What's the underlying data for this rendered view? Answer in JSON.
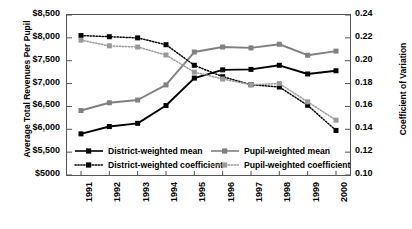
{
  "chart_data": {
    "type": "line",
    "title": "",
    "xlabel": "",
    "ylabel": "Average Total Revenues Per Pupil",
    "y2label": "Coefficient of Variation",
    "categories": [
      "1991",
      "1992",
      "1993",
      "1994",
      "1995",
      "1996",
      "1997",
      "1998",
      "1999",
      "2000"
    ],
    "ylim": [
      5000,
      8500
    ],
    "y2lim": [
      0.1,
      0.24
    ],
    "yticks": [
      "$5000",
      "$5,500",
      "$6,000",
      "$6,500",
      "$7,000",
      "$7,500",
      "$8,000",
      "$8,500"
    ],
    "ytick_values": [
      5000,
      5500,
      6000,
      6500,
      7000,
      7500,
      8000,
      8500
    ],
    "y2ticks": [
      "0.10",
      "0.12",
      "0.14",
      "0.16",
      "0.18",
      "0.20",
      "0.22",
      "0.24"
    ],
    "y2tick_values": [
      0.1,
      0.12,
      0.14,
      0.16,
      0.18,
      0.2,
      0.22,
      0.24
    ],
    "grid": false,
    "legend_position": "bottom-inside",
    "series": [
      {
        "name": "District-weighted mean",
        "axis": "left",
        "color": "#000000",
        "style": "solid",
        "marker": "square",
        "values": [
          5900,
          6060,
          6130,
          6520,
          7120,
          7300,
          7310,
          7400,
          7210,
          7280
        ]
      },
      {
        "name": "Pupil-weighted mean",
        "axis": "left",
        "color": "#808080",
        "style": "solid",
        "marker": "square",
        "values": [
          6410,
          6580,
          6640,
          6970,
          7690,
          7800,
          7780,
          7860,
          7620,
          7710
        ]
      },
      {
        "name": "District-weighted coefficient",
        "axis": "right",
        "color": "#000000",
        "style": "dotted",
        "marker": "square",
        "values": [
          0.222,
          0.221,
          0.22,
          0.214,
          0.196,
          0.186,
          0.179,
          0.177,
          0.161,
          0.139
        ]
      },
      {
        "name": "Pupil-weighted coefficient",
        "axis": "right",
        "color": "#9a9a9a",
        "style": "dotted",
        "marker": "square",
        "values": [
          0.218,
          0.213,
          0.212,
          0.205,
          0.19,
          0.184,
          0.179,
          0.18,
          0.164,
          0.148
        ]
      }
    ]
  },
  "legend": {
    "items": [
      {
        "label": "District-weighted mean"
      },
      {
        "label": "Pupil-weighted mean"
      },
      {
        "label": "District-weighted coefficient"
      },
      {
        "label": "Pupil-weighted coefficient"
      }
    ]
  }
}
